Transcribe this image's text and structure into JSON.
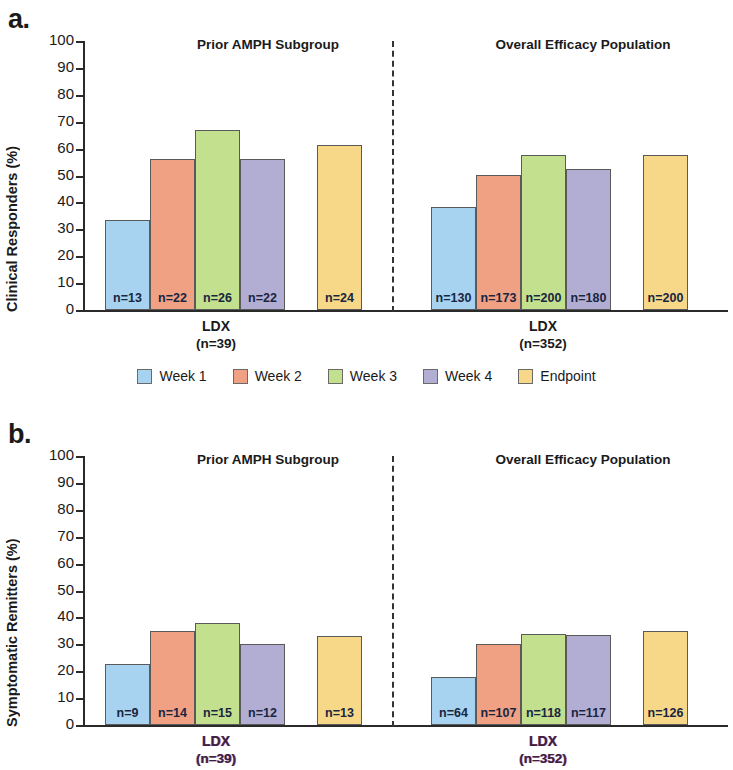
{
  "figure": {
    "panels": [
      {
        "letter": "a.",
        "ylabel": "Clinical Responders (%)",
        "groups": [
          {
            "title": "Prior AMPH Subgroup",
            "xlabel": "LDX",
            "xsublabel": "(n=39)"
          },
          {
            "title": "Overall Efficacy Population",
            "xlabel": "LDX",
            "xsublabel": "(n=352)"
          }
        ]
      },
      {
        "letter": "b.",
        "ylabel": "Symptomatic Remitters (%)",
        "groups": [
          {
            "title": "Prior AMPH Subgroup",
            "xlabel": "LDX",
            "xsublabel": "(n=39)"
          },
          {
            "title": "Overall Efficacy Population",
            "xlabel": "LDX",
            "xsublabel": "(n=352)"
          }
        ]
      }
    ]
  },
  "legend": {
    "items": [
      {
        "label": "Week 1",
        "color": "#A7D3F0"
      },
      {
        "label": "Week 2",
        "color": "#F0A183"
      },
      {
        "label": "Week 3",
        "color": "#C3E08E"
      },
      {
        "label": "Week 4",
        "color": "#B2AED3"
      },
      {
        "label": "Endpoint",
        "color": "#F7D888"
      }
    ]
  },
  "yticks": [
    "0",
    "10",
    "20",
    "30",
    "40",
    "50",
    "60",
    "70",
    "80",
    "90",
    "100"
  ],
  "chart_data": [
    {
      "type": "bar",
      "title": "a. Clinical Responders (%)",
      "xlabel": "",
      "ylabel": "Clinical Responders (%)",
      "ylim": [
        0,
        100
      ],
      "yticks": [
        0,
        10,
        20,
        30,
        40,
        50,
        60,
        70,
        80,
        90,
        100
      ],
      "grid": false,
      "legend_position": "bottom-center",
      "categories": [
        "Week 1",
        "Week 2",
        "Week 3",
        "Week 4",
        "Endpoint"
      ],
      "groups": [
        {
          "name": "Prior AMPH Subgroup",
          "axis_label": "LDX",
          "axis_sublabel": "(n=39)",
          "values": [
            33.3,
            56.3,
            67.0,
            56.3,
            61.5
          ],
          "n_labels": [
            "n=13",
            "n=22",
            "n=26",
            "n=22",
            "n=24"
          ]
        },
        {
          "name": "Overall Efficacy Population",
          "axis_label": "LDX",
          "axis_sublabel": "(n=352)",
          "values": [
            38.3,
            50.3,
            57.5,
            52.3,
            57.5
          ],
          "n_labels": [
            "n=130",
            "n=173",
            "n=200",
            "n=180",
            "n=200"
          ]
        }
      ]
    },
    {
      "type": "bar",
      "title": "b. Symptomatic Remitters (%)",
      "xlabel": "",
      "ylabel": "Symptomatic Remitters (%)",
      "ylim": [
        0,
        100
      ],
      "yticks": [
        0,
        10,
        20,
        30,
        40,
        50,
        60,
        70,
        80,
        90,
        100
      ],
      "grid": false,
      "legend_position": "shared-with-panel-a",
      "categories": [
        "Week 1",
        "Week 2",
        "Week 3",
        "Week 4",
        "Endpoint"
      ],
      "groups": [
        {
          "name": "Prior AMPH Subgroup",
          "axis_label": "LDX",
          "axis_sublabel": "(n=39)",
          "values": [
            22.5,
            35.0,
            38.0,
            30.0,
            33.0
          ],
          "n_labels": [
            "n=9",
            "n=14",
            "n=15",
            "n=12",
            "n=13"
          ]
        },
        {
          "name": "Overall Efficacy Population",
          "axis_label": "LDX",
          "axis_sublabel": "(n=352)",
          "values": [
            18.0,
            30.0,
            34.0,
            33.5,
            35.0
          ],
          "n_labels": [
            "n=64",
            "n=107",
            "n=118",
            "n=117",
            "n=126"
          ]
        }
      ]
    }
  ]
}
